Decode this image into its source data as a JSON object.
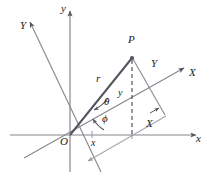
{
  "figure": {
    "type": "geometry-diagram",
    "background_color": "#ffffff",
    "stroke_color_primary": "#6e6e78",
    "stroke_color_dark": "#55555f",
    "stroke_color_light": "#9a9aa4",
    "text_color": "#1a1a1a"
  },
  "axes": [
    {
      "id": "x-axis",
      "label": "x",
      "description": "horizontal axis pointing right, with arrowhead",
      "label_x": 196,
      "label_y": 140
    },
    {
      "id": "y-axis",
      "label": "y",
      "description": "vertical axis pointing up, with arrowhead",
      "label_x": 63,
      "label_y": 9
    },
    {
      "id": "X-axis-rotated",
      "label": "X",
      "description": "rotated axis pointing up-right, with arrowhead",
      "label_x": 190,
      "label_y": 73
    },
    {
      "id": "Y-axis-rotated",
      "label": "Y",
      "description": "rotated axis pointing up-left, with arrowhead",
      "label_x": 21,
      "label_y": 26
    }
  ],
  "points": [
    {
      "id": "origin",
      "label": "O",
      "label_x": 62,
      "label_y": 140,
      "x": 70,
      "y": 135
    },
    {
      "id": "point-p",
      "label": "P",
      "label_x": 129,
      "label_y": 39,
      "x": 132,
      "y": 57
    }
  ],
  "segments": [
    {
      "id": "radius",
      "label": "r",
      "description": "line from origin O to point P",
      "label_x": 97,
      "label_y": 78
    },
    {
      "id": "y-component",
      "label": "y",
      "description": "dashed vertical line from P down to x-axis",
      "label_x": 119,
      "label_y": 92
    },
    {
      "id": "x-component",
      "label": "x",
      "description": "segment along x-axis from origin to foot of perpendicular",
      "label_x": 92,
      "label_y": 142
    },
    {
      "id": "X-component",
      "label": "X",
      "description": "projection of P on rotated X axis",
      "label_x": 147,
      "label_y": 122
    },
    {
      "id": "Y-component",
      "label": "Y",
      "description": "projection of P on rotated Y axis",
      "label_x": 152,
      "label_y": 63
    }
  ],
  "angles": [
    {
      "id": "theta",
      "label": "θ",
      "description": "angle between rotated X axis and line OP",
      "label_x": 104,
      "label_y": 101
    },
    {
      "id": "phi",
      "label": "ϕ",
      "description": "angle between x axis and rotated X axis",
      "label_x": 102,
      "label_y": 118
    }
  ]
}
